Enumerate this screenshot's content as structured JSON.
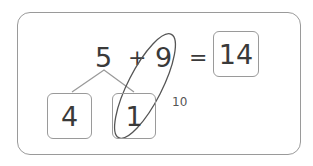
{
  "problem": {
    "addend_a": "5",
    "plus": "+",
    "addend_b": "9",
    "equals": "=",
    "answer": "14"
  },
  "decomposition": {
    "part_left": "4",
    "part_right": "1",
    "make_ten_label": "10"
  },
  "colors": {
    "stroke": "#9a9a9a",
    "text": "#3a3a3a",
    "ellipse": "#555555"
  }
}
